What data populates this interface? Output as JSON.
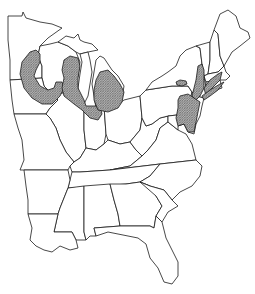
{
  "map": {
    "description": "Outline map of the eastern United States with shaded distribution range",
    "region": "Eastern United States",
    "colors": {
      "outline": "#1a1a1a",
      "background": "#ffffff",
      "range_fill": "#9a9a9a"
    },
    "legend": null,
    "shaded_ranges": [
      {
        "name": "Upper Midwest range",
        "area": "Minnesota / Wisconsin / Iowa band"
      },
      {
        "name": "Lake Michigan range",
        "area": "Wisconsin / Illinois / Indiana around southern Lake Michigan"
      },
      {
        "name": "Lower Michigan range",
        "area": "Southern Lower Michigan, northern Indiana and Ohio"
      },
      {
        "name": "Western New York patch",
        "area": "Small patch in western New York"
      },
      {
        "name": "Northeast coastal range",
        "area": "Hudson Valley, Connecticut, Massachusetts, New Jersey, Pennsylvania, Delaware, Maryland"
      }
    ]
  }
}
